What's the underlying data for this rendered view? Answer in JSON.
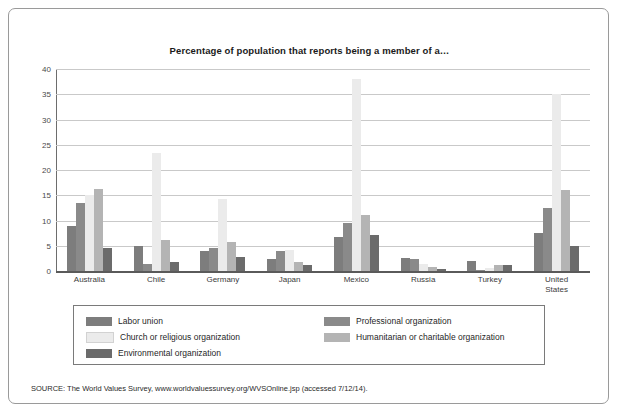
{
  "figure": {
    "title": "Percentage of population that reports being a member of a…",
    "source": "SOURCE: The World Values Survey, www.worldvaluessurvey.org/WVSOnline.jsp (accessed 7/12/14)."
  },
  "colors": {
    "labor_union": "#7d7d7d",
    "professional_organization": "#8a8a8a",
    "church_or_religious": "#ebebeb",
    "humanitarian_or_charitable": "#b4b4b4",
    "environmental_organization": "#6b6b6b",
    "gridline": "#c9c9c9",
    "axis": "#5a5a5a",
    "border": "#9a9a9a"
  },
  "chart_data": {
    "type": "bar",
    "title": "Percentage of population that reports being a member of a…",
    "xlabel": "",
    "ylabel": "",
    "ylim": [
      0,
      40
    ],
    "yticks": [
      0,
      5,
      10,
      15,
      20,
      25,
      30,
      35,
      40
    ],
    "grid": true,
    "legend_position": "bottom",
    "categories": [
      "Australia",
      "Chile",
      "Germany",
      "Japan",
      "Mexico",
      "Russia",
      "Turkey",
      "United States"
    ],
    "series": [
      {
        "name": "Labor union",
        "color": "#7d7d7d",
        "values": [
          9.0,
          5.0,
          4.0,
          2.3,
          6.8,
          2.5,
          2.0,
          7.5
        ]
      },
      {
        "name": "Professional organization",
        "color": "#8a8a8a",
        "values": [
          13.5,
          1.3,
          4.5,
          4.0,
          9.5,
          2.3,
          0.3,
          12.5
        ]
      },
      {
        "name": "Church or religious organization",
        "color": "#ebebeb",
        "values": [
          15.0,
          23.3,
          14.3,
          4.2,
          38.0,
          1.3,
          0.5,
          35.0
        ]
      },
      {
        "name": "Humanitarian or charitable organization",
        "color": "#b4b4b4",
        "values": [
          16.3,
          6.2,
          5.8,
          1.8,
          11.0,
          0.8,
          1.2,
          16.0
        ]
      },
      {
        "name": "Environmental organization",
        "color": "#6b6b6b",
        "values": [
          4.5,
          1.8,
          2.8,
          1.2,
          7.2,
          0.4,
          1.2,
          5.0
        ]
      }
    ]
  },
  "legend": {
    "left_column": [
      {
        "label": "Labor union",
        "color": "#7d7d7d"
      },
      {
        "label": "Church or religious organization",
        "color": "#ebebeb"
      },
      {
        "label": "Environmental organization",
        "color": "#6b6b6b"
      }
    ],
    "right_column": [
      {
        "label": "Professional organization",
        "color": "#8a8a8a"
      },
      {
        "label": "Humanitarian or charitable organization",
        "color": "#b4b4b4"
      }
    ]
  }
}
